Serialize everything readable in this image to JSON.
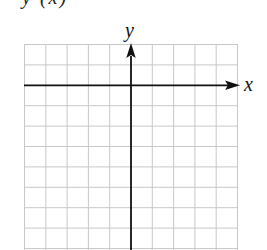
{
  "header": {
    "fragment": "y (x)"
  },
  "graph": {
    "x_axis_label": "x",
    "y_axis_label": "y",
    "grid": {
      "columns": 10,
      "rows": 10,
      "line_color": "#c8c8c8"
    },
    "axis_color": "#111111"
  }
}
